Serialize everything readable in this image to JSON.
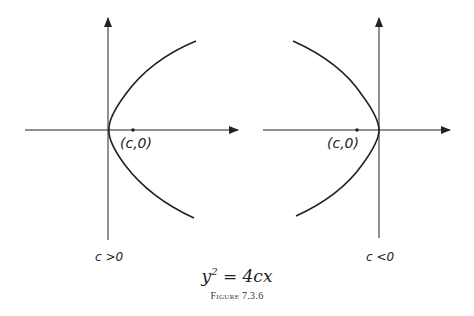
{
  "left_panel": {
    "point_label": "(c,0)",
    "condition_label": "c >0"
  },
  "right_panel": {
    "point_label": "(c,0)",
    "condition_label": "c <0"
  },
  "equation": {
    "lhs": "y",
    "exponent": "2",
    "rhs": " = 4cx"
  },
  "caption": "Figure 7.3.6"
}
